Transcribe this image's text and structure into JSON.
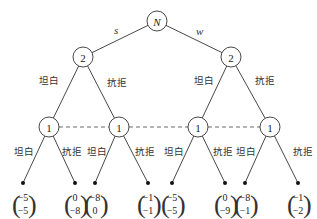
{
  "diagram": {
    "type": "extensive-form game tree",
    "root": {
      "label": "N",
      "x": 157,
      "y": 21
    },
    "moves_root": [
      {
        "label": "s",
        "x": 114,
        "y": 34
      },
      {
        "label": "w",
        "x": 196,
        "y": 35
      }
    ],
    "level2": [
      {
        "label": "2",
        "x": 83,
        "y": 57
      },
      {
        "label": "2",
        "x": 231,
        "y": 57
      }
    ],
    "level2_branch_labels": [
      {
        "label": "坦白",
        "x": 39,
        "y": 84
      },
      {
        "label": "抗拒",
        "x": 107,
        "y": 86
      },
      {
        "label": "坦白",
        "x": 194,
        "y": 84
      },
      {
        "label": "抗拒",
        "x": 255,
        "y": 84
      }
    ],
    "level3": [
      {
        "label": "1",
        "x": 49,
        "y": 127
      },
      {
        "label": "1",
        "x": 119,
        "y": 127
      },
      {
        "label": "1",
        "x": 198,
        "y": 127
      },
      {
        "label": "1",
        "x": 270,
        "y": 127
      }
    ],
    "level3_branch_labels": [
      {
        "label": "坦白",
        "x": 14,
        "y": 155
      },
      {
        "label": "抗拒",
        "x": 62,
        "y": 155
      },
      {
        "label": "坦白",
        "x": 87,
        "y": 155
      },
      {
        "label": "抗拒",
        "x": 135,
        "y": 155
      },
      {
        "label": "坦白",
        "x": 164,
        "y": 155
      },
      {
        "label": "抗拒",
        "x": 213,
        "y": 155
      },
      {
        "label": "坦白",
        "x": 236,
        "y": 155
      },
      {
        "label": "抗拒",
        "x": 293,
        "y": 155
      }
    ],
    "leaves": [
      {
        "x": 23,
        "y": 183,
        "top": "−5",
        "bottom": "−5"
      },
      {
        "x": 75,
        "y": 183,
        "top": "0",
        "bottom": "−8"
      },
      {
        "x": 95,
        "y": 183,
        "top": "−8",
        "bottom": "0"
      },
      {
        "x": 148,
        "y": 183,
        "top": "−1",
        "bottom": "−1"
      },
      {
        "x": 172,
        "y": 183,
        "top": "−5",
        "bottom": "−5"
      },
      {
        "x": 225,
        "y": 183,
        "top": "0",
        "bottom": "−9"
      },
      {
        "x": 245,
        "y": 183,
        "top": "−8",
        "bottom": "−1"
      },
      {
        "x": 298,
        "y": 183,
        "top": "−1",
        "bottom": "−2"
      }
    ],
    "information_set": "dashed line connecting all four player-1 nodes"
  }
}
